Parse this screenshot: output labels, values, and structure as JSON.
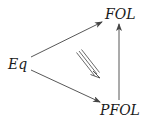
{
  "diagram": {
    "type": "commutative-diagram",
    "nodes": [
      {
        "id": "fol",
        "label": "FOL"
      },
      {
        "id": "eq",
        "label": "Eq"
      },
      {
        "id": "pfol",
        "label": "PFOL"
      }
    ],
    "edges": [
      {
        "from": "eq",
        "to": "fol",
        "style": "single-arrow"
      },
      {
        "from": "eq",
        "to": "pfol",
        "style": "single-arrow"
      },
      {
        "from": "pfol",
        "to": "fol",
        "style": "single-arrow"
      },
      {
        "from": "center",
        "to": "pfol-direction",
        "style": "triple-arrow (2-cell)"
      }
    ],
    "colors": {
      "stroke": "#444444",
      "text": "#1a1a1a",
      "background": "#ffffff"
    }
  }
}
